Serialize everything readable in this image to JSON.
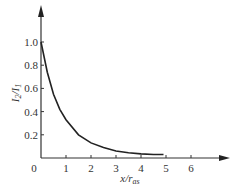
{
  "chart_data": {
    "type": "line",
    "title": "",
    "xlabel": "x/r_as",
    "ylabel": "I_2/I_1",
    "xlabel_parts": {
      "main": "x/r",
      "sub": "as"
    },
    "ylabel_parts": {
      "a": "I",
      "a_sub": "2",
      "sep": "/",
      "b": "I",
      "b_sub": "1"
    },
    "xlim": [
      0,
      7
    ],
    "ylim": [
      0,
      1.15
    ],
    "x_ticks": [
      1,
      2,
      3,
      4,
      5,
      6
    ],
    "y_ticks": [
      0.2,
      0.4,
      0.6,
      0.8,
      1.0
    ],
    "x_tick_labels": [
      "1",
      "2",
      "3",
      "4",
      "5",
      "6"
    ],
    "y_tick_labels": [
      "0.2",
      "0.4",
      "0.6",
      "0.8",
      "1.0"
    ],
    "origin_label": "0",
    "grid": false,
    "legend": null,
    "series": [
      {
        "name": "I2/I1",
        "x": [
          0,
          0.25,
          0.5,
          0.75,
          1.0,
          1.5,
          2.0,
          2.5,
          3.0,
          3.5,
          4.0,
          4.5,
          4.9
        ],
        "values": [
          1.0,
          0.74,
          0.55,
          0.42,
          0.33,
          0.2,
          0.13,
          0.09,
          0.06,
          0.045,
          0.035,
          0.03,
          0.03
        ]
      }
    ]
  }
}
